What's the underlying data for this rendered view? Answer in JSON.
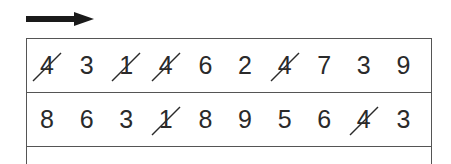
{
  "arrow": {
    "direction": "right",
    "color": "#1a1a1a"
  },
  "grid": {
    "line_color": "#555555",
    "rows": [
      {
        "digits": [
          "4",
          "3",
          "1",
          "4",
          "6",
          "2",
          "4",
          "7",
          "3",
          "9"
        ],
        "crossed": [
          true,
          false,
          true,
          true,
          false,
          false,
          true,
          false,
          false,
          false
        ]
      },
      {
        "digits": [
          "8",
          "6",
          "3",
          "1",
          "8",
          "9",
          "5",
          "6",
          "4",
          "3"
        ],
        "crossed": [
          false,
          false,
          false,
          true,
          false,
          false,
          false,
          false,
          true,
          false
        ]
      }
    ]
  }
}
